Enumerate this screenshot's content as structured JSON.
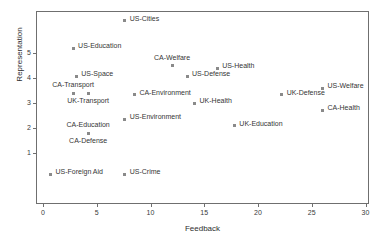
{
  "chart_data": {
    "type": "scatter",
    "title": "",
    "xlabel": "Feedback",
    "ylabel": "Representation",
    "xlim": [
      0,
      30.4
    ],
    "ylim": [
      0,
      6.7
    ],
    "xticks": [
      0,
      5,
      10,
      15,
      20,
      25,
      30
    ],
    "xticklabels": [
      "0",
      "5",
      "10",
      "15",
      "20",
      "25",
      "30"
    ],
    "yticks": [
      1,
      2,
      3,
      4,
      5
    ],
    "yticklabels": [
      "1",
      "2",
      "3",
      "4",
      "5"
    ],
    "grid": false,
    "legend": null,
    "marker_color": "#8a8a8a",
    "axis_color": "#6f6f6f",
    "points": [
      {
        "label": "US-Cities",
        "x": 7.6,
        "y": 6.3,
        "label_pos": "right"
      },
      {
        "label": "US-Education",
        "x": 2.8,
        "y": 5.2,
        "label_pos": "right"
      },
      {
        "label": "CA-Welfare",
        "x": 12.0,
        "y": 4.5,
        "label_pos": "above"
      },
      {
        "label": "US-Health",
        "x": 16.2,
        "y": 4.4,
        "label_pos": "right"
      },
      {
        "label": "US-Defense",
        "x": 13.4,
        "y": 4.08,
        "label_pos": "right"
      },
      {
        "label": "US-Space",
        "x": 3.1,
        "y": 4.08,
        "label_pos": "right"
      },
      {
        "label": "US-Welfare",
        "x": 26.0,
        "y": 3.6,
        "label_pos": "right"
      },
      {
        "label": "CA-Transport",
        "x": 2.8,
        "y": 3.4,
        "label_pos": "above"
      },
      {
        "label": "UK-Defense",
        "x": 22.2,
        "y": 3.33,
        "label_pos": "right"
      },
      {
        "label": "CA-Environment",
        "x": 8.5,
        "y": 3.33,
        "label_pos": "right"
      },
      {
        "label": "UK-Transport",
        "x": 4.2,
        "y": 3.4,
        "label_pos": "below"
      },
      {
        "label": "UK-Health",
        "x": 14.1,
        "y": 3.0,
        "label_pos": "right"
      },
      {
        "label": "CA-Health",
        "x": 26.0,
        "y": 2.72,
        "label_pos": "right"
      },
      {
        "label": "US-Environment",
        "x": 7.6,
        "y": 2.35,
        "label_pos": "right"
      },
      {
        "label": "UK-Education",
        "x": 17.8,
        "y": 2.1,
        "label_pos": "right"
      },
      {
        "label": "CA-Education",
        "x": 4.2,
        "y": 1.8,
        "label_pos": "above"
      },
      {
        "label": "CA-Defense",
        "x": 4.2,
        "y": 1.8,
        "label_pos": "below"
      },
      {
        "label": "US-Foreign Aid",
        "x": 0.7,
        "y": 0.15,
        "label_pos": "right"
      },
      {
        "label": "US-Crime",
        "x": 7.6,
        "y": 0.15,
        "label_pos": "right"
      }
    ]
  }
}
